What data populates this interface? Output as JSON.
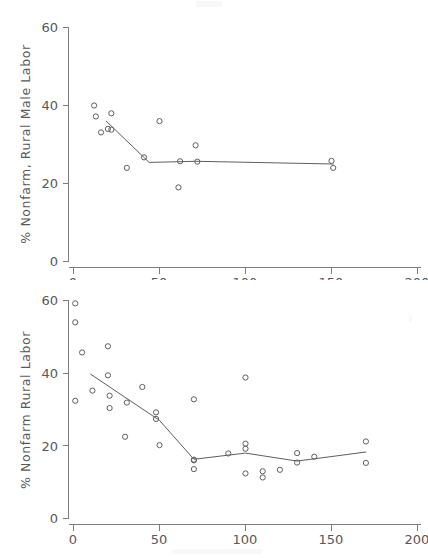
{
  "figure": {
    "background_color": "#ffffff",
    "ink_color": "#5e5e62",
    "panel_count": 2
  },
  "chart_data": [
    {
      "id": "top",
      "type": "scatter",
      "title": "",
      "subtitle": "",
      "xlabel": "",
      "ylabel": "% Nonfarm, Rural Male Labor",
      "xlim": [
        0,
        200
      ],
      "ylim": [
        0,
        60
      ],
      "xticks": [
        0,
        50,
        100,
        150,
        200
      ],
      "xticklabels": [
        "0",
        "50",
        "100",
        "150",
        "200"
      ],
      "yticks": [
        0,
        20,
        40,
        60
      ],
      "yticklabels": [
        "0",
        "20",
        "40",
        "60"
      ],
      "grid": false,
      "legend": null,
      "marker": "open-circle",
      "series": [
        {
          "name": "observations",
          "x": [
            12,
            13,
            16,
            20,
            22,
            22,
            31,
            41,
            50,
            61,
            62,
            71,
            72,
            150,
            151
          ],
          "y": [
            40.0,
            37.2,
            33.1,
            34.0,
            38.0,
            33.8,
            24.0,
            26.7,
            36.0,
            19.0,
            25.7,
            29.8,
            25.6,
            25.8,
            24.0
          ]
        },
        {
          "name": "fitted-trend",
          "type": "line",
          "x": [
            19,
            44,
            71,
            151
          ],
          "y": [
            36.0,
            25.4,
            25.7,
            25.0
          ]
        }
      ],
      "extra_points_note": "one low point near (50, 15)"
    },
    {
      "id": "bottom",
      "type": "scatter",
      "title": "",
      "subtitle": "",
      "xlabel": "",
      "ylabel": "% Nonfarm Rural Labor",
      "xlim": [
        0,
        200
      ],
      "ylim": [
        0,
        60
      ],
      "xticks": [
        0,
        50,
        100,
        150,
        200
      ],
      "xticklabels": [
        "0",
        "50",
        "100",
        "150",
        "200"
      ],
      "yticks": [
        0,
        20,
        40,
        60
      ],
      "yticklabels": [
        "0",
        "20",
        "40",
        "60"
      ],
      "grid": false,
      "legend": null,
      "marker": "open-circle",
      "series": [
        {
          "name": "observations",
          "x": [
            1,
            1,
            1,
            5,
            11,
            20,
            20,
            21,
            21,
            30,
            31,
            40,
            48,
            48,
            50,
            70,
            70,
            70,
            70,
            90,
            100,
            100,
            100,
            100,
            110,
            110,
            120,
            130,
            130,
            140,
            170,
            170
          ],
          "y": [
            59.2,
            54.0,
            32.4,
            45.7,
            35.2,
            47.4,
            39.4,
            33.8,
            30.4,
            22.5,
            31.9,
            36.2,
            29.2,
            27.4,
            20.2,
            32.8,
            16.2,
            16.0,
            13.6,
            17.9,
            38.8,
            20.6,
            19.2,
            12.4,
            13.0,
            11.3,
            13.4,
            18.0,
            15.4,
            17.0,
            21.2,
            15.3
          ]
        },
        {
          "name": "fitted-trend",
          "type": "line",
          "x": [
            10,
            50,
            70,
            100,
            130,
            170
          ],
          "y": [
            39.7,
            27.0,
            16.3,
            18.0,
            15.8,
            18.3
          ]
        }
      ]
    }
  ]
}
